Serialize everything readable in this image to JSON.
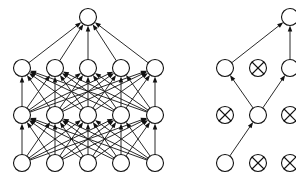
{
  "figure": {
    "background_color": "#ffffff",
    "ink_color": "#111111",
    "width": 296,
    "height": 186,
    "panels": [
      {
        "id": "standard-net",
        "name": "Standard Neural Net",
        "caption": "",
        "node_radius": 8.5,
        "stroke_width": 1.1,
        "edge_stroke_width": 0.9,
        "arrowheads": true,
        "arrow_size": 3.6,
        "layers": [
          {
            "id": "output",
            "role": "output",
            "y": 17,
            "nodes": [
              {
                "id": "L-out-1",
                "x": 88,
                "state": "active",
                "glyph": "circle"
              }
            ]
          },
          {
            "id": "hidden-2",
            "role": "hidden",
            "y": 68,
            "nodes": [
              {
                "id": "L-h2-1",
                "x": 22,
                "state": "active",
                "glyph": "circle"
              },
              {
                "id": "L-h2-2",
                "x": 55,
                "state": "active",
                "glyph": "circle"
              },
              {
                "id": "L-h2-3",
                "x": 88,
                "state": "active",
                "glyph": "circle"
              },
              {
                "id": "L-h2-4",
                "x": 121,
                "state": "active",
                "glyph": "circle"
              },
              {
                "id": "L-h2-5",
                "x": 155,
                "state": "active",
                "glyph": "circle"
              }
            ]
          },
          {
            "id": "hidden-1",
            "role": "hidden",
            "y": 115,
            "nodes": [
              {
                "id": "L-h1-1",
                "x": 22,
                "state": "active",
                "glyph": "circle"
              },
              {
                "id": "L-h1-2",
                "x": 55,
                "state": "active",
                "glyph": "circle"
              },
              {
                "id": "L-h1-3",
                "x": 88,
                "state": "active",
                "glyph": "circle"
              },
              {
                "id": "L-h1-4",
                "x": 121,
                "state": "active",
                "glyph": "circle"
              },
              {
                "id": "L-h1-5",
                "x": 155,
                "state": "active",
                "glyph": "circle"
              }
            ]
          },
          {
            "id": "input",
            "role": "input",
            "y": 163,
            "nodes": [
              {
                "id": "L-in-1",
                "x": 22,
                "state": "active",
                "glyph": "circle"
              },
              {
                "id": "L-in-2",
                "x": 55,
                "state": "active",
                "glyph": "circle"
              },
              {
                "id": "L-in-3",
                "x": 88,
                "state": "active",
                "glyph": "circle"
              },
              {
                "id": "L-in-4",
                "x": 121,
                "state": "active",
                "glyph": "circle"
              },
              {
                "id": "L-in-5",
                "x": 155,
                "state": "active",
                "glyph": "circle"
              }
            ]
          }
        ],
        "connectivity": "fully-connected",
        "connections": [
          {
            "from": "L-in-1",
            "to": "L-h1-1"
          },
          {
            "from": "L-in-1",
            "to": "L-h1-2"
          },
          {
            "from": "L-in-1",
            "to": "L-h1-3"
          },
          {
            "from": "L-in-1",
            "to": "L-h1-4"
          },
          {
            "from": "L-in-1",
            "to": "L-h1-5"
          },
          {
            "from": "L-in-2",
            "to": "L-h1-1"
          },
          {
            "from": "L-in-2",
            "to": "L-h1-2"
          },
          {
            "from": "L-in-2",
            "to": "L-h1-3"
          },
          {
            "from": "L-in-2",
            "to": "L-h1-4"
          },
          {
            "from": "L-in-2",
            "to": "L-h1-5"
          },
          {
            "from": "L-in-3",
            "to": "L-h1-1"
          },
          {
            "from": "L-in-3",
            "to": "L-h1-2"
          },
          {
            "from": "L-in-3",
            "to": "L-h1-3"
          },
          {
            "from": "L-in-3",
            "to": "L-h1-4"
          },
          {
            "from": "L-in-3",
            "to": "L-h1-5"
          },
          {
            "from": "L-in-4",
            "to": "L-h1-1"
          },
          {
            "from": "L-in-4",
            "to": "L-h1-2"
          },
          {
            "from": "L-in-4",
            "to": "L-h1-3"
          },
          {
            "from": "L-in-4",
            "to": "L-h1-4"
          },
          {
            "from": "L-in-4",
            "to": "L-h1-5"
          },
          {
            "from": "L-in-5",
            "to": "L-h1-1"
          },
          {
            "from": "L-in-5",
            "to": "L-h1-2"
          },
          {
            "from": "L-in-5",
            "to": "L-h1-3"
          },
          {
            "from": "L-in-5",
            "to": "L-h1-4"
          },
          {
            "from": "L-in-5",
            "to": "L-h1-5"
          },
          {
            "from": "L-h1-1",
            "to": "L-h2-1"
          },
          {
            "from": "L-h1-1",
            "to": "L-h2-2"
          },
          {
            "from": "L-h1-1",
            "to": "L-h2-3"
          },
          {
            "from": "L-h1-1",
            "to": "L-h2-4"
          },
          {
            "from": "L-h1-1",
            "to": "L-h2-5"
          },
          {
            "from": "L-h1-2",
            "to": "L-h2-1"
          },
          {
            "from": "L-h1-2",
            "to": "L-h2-2"
          },
          {
            "from": "L-h1-2",
            "to": "L-h2-3"
          },
          {
            "from": "L-h1-2",
            "to": "L-h2-4"
          },
          {
            "from": "L-h1-2",
            "to": "L-h2-5"
          },
          {
            "from": "L-h1-3",
            "to": "L-h2-1"
          },
          {
            "from": "L-h1-3",
            "to": "L-h2-2"
          },
          {
            "from": "L-h1-3",
            "to": "L-h2-3"
          },
          {
            "from": "L-h1-3",
            "to": "L-h2-4"
          },
          {
            "from": "L-h1-3",
            "to": "L-h2-5"
          },
          {
            "from": "L-h1-4",
            "to": "L-h2-1"
          },
          {
            "from": "L-h1-4",
            "to": "L-h2-2"
          },
          {
            "from": "L-h1-4",
            "to": "L-h2-3"
          },
          {
            "from": "L-h1-4",
            "to": "L-h2-4"
          },
          {
            "from": "L-h1-4",
            "to": "L-h2-5"
          },
          {
            "from": "L-h1-5",
            "to": "L-h2-1"
          },
          {
            "from": "L-h1-5",
            "to": "L-h2-2"
          },
          {
            "from": "L-h1-5",
            "to": "L-h2-3"
          },
          {
            "from": "L-h1-5",
            "to": "L-h2-4"
          },
          {
            "from": "L-h1-5",
            "to": "L-h2-5"
          },
          {
            "from": "L-h2-1",
            "to": "L-out-1"
          },
          {
            "from": "L-h2-2",
            "to": "L-out-1"
          },
          {
            "from": "L-h2-3",
            "to": "L-out-1"
          },
          {
            "from": "L-h2-4",
            "to": "L-out-1"
          },
          {
            "from": "L-h2-5",
            "to": "L-out-1"
          }
        ]
      },
      {
        "id": "dropout-net",
        "name": "Network after applying dropout",
        "caption": "",
        "node_radius": 8.5,
        "stroke_width": 1.1,
        "edge_stroke_width": 0.9,
        "arrowheads": true,
        "arrow_size": 3.6,
        "clipped_right_edge": true,
        "layers": [
          {
            "id": "output",
            "role": "output",
            "y": 17,
            "nodes": [
              {
                "id": "R-out-1",
                "x": 290,
                "state": "active",
                "glyph": "circle"
              }
            ]
          },
          {
            "id": "hidden-2",
            "role": "hidden",
            "y": 68,
            "nodes": [
              {
                "id": "R-h2-1",
                "x": 225,
                "state": "active",
                "glyph": "circle"
              },
              {
                "id": "R-h2-2",
                "x": 258,
                "state": "dropped",
                "glyph": "crossed-circle"
              },
              {
                "id": "R-h2-3",
                "x": 290,
                "state": "active",
                "glyph": "circle"
              }
            ]
          },
          {
            "id": "hidden-1",
            "role": "hidden",
            "y": 115,
            "nodes": [
              {
                "id": "R-h1-1",
                "x": 225,
                "state": "dropped",
                "glyph": "crossed-circle"
              },
              {
                "id": "R-h1-2",
                "x": 258,
                "state": "active",
                "glyph": "circle"
              },
              {
                "id": "R-h1-3",
                "x": 290,
                "state": "dropped",
                "glyph": "crossed-circle"
              }
            ]
          },
          {
            "id": "input",
            "role": "input",
            "y": 163,
            "nodes": [
              {
                "id": "R-in-1",
                "x": 225,
                "state": "active",
                "glyph": "circle"
              },
              {
                "id": "R-in-2",
                "x": 258,
                "state": "dropped",
                "glyph": "crossed-circle"
              },
              {
                "id": "R-in-3",
                "x": 290,
                "state": "dropped",
                "glyph": "crossed-circle"
              }
            ]
          }
        ],
        "connectivity": "thinned",
        "connections": [
          {
            "from": "R-in-1",
            "to": "R-h1-2"
          },
          {
            "from": "R-h1-2",
            "to": "R-h2-1"
          },
          {
            "from": "R-h1-2",
            "to": "R-h2-3"
          },
          {
            "from": "R-h2-1",
            "to": "R-out-1"
          },
          {
            "from": "R-h2-3",
            "to": "R-out-1"
          }
        ]
      }
    ],
    "legend": {
      "active_node_label": "retained unit",
      "dropped_node_label": "dropped unit",
      "edge_label": "weighted connection"
    }
  }
}
